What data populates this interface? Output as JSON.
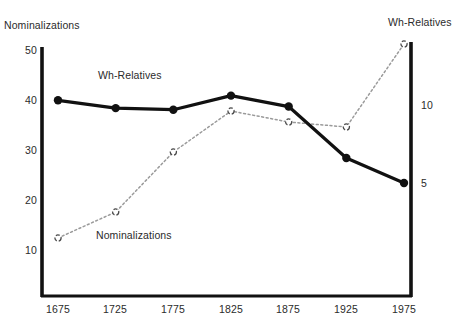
{
  "chart_data": {
    "type": "line",
    "title": "",
    "xlabel": "",
    "ylabel": "Nominalizations",
    "y2label": "Wh-Relatives",
    "categories": [
      "1675",
      "1725",
      "1775",
      "1825",
      "1875",
      "1925",
      "1975"
    ],
    "x": [
      1675,
      1725,
      1775,
      1825,
      1875,
      1925,
      1975
    ],
    "xlim": [
      1660,
      1990
    ],
    "ylim": [
      0.4,
      50.4
    ],
    "y2lim": [
      0.6,
      13.9
    ],
    "grid": false,
    "legend_position": "inline-annotation",
    "series": [
      {
        "name": "Nominalizations",
        "axis": "left",
        "style": "dotted",
        "marker": "open-circle",
        "color": "#8c8c8c",
        "values": [
          12.4,
          17.6,
          29.6,
          37.8,
          35.6,
          34.6,
          51.2
        ]
      },
      {
        "name": "Wh-Relatives",
        "axis": "right",
        "style": "solid",
        "marker": "filled-circle",
        "color": "#111111",
        "values": [
          10.3,
          9.8,
          9.7,
          10.6,
          9.9,
          6.6,
          5.0
        ]
      }
    ],
    "left_axis_ticks": [
      10,
      20,
      30,
      40,
      50
    ],
    "right_axis_ticks": [
      5,
      10
    ],
    "annotations": [
      {
        "text": "Wh-Relatives",
        "where": "inside-plot-upper-left"
      },
      {
        "text": "Nominalizations",
        "where": "inside-plot-lower-left"
      }
    ]
  },
  "axes": {
    "left_title": "Nominalizations",
    "right_title": "Wh-Relatives",
    "left_ticks": [
      "50",
      "40",
      "30",
      "20",
      "10"
    ],
    "right_ticks": [
      "10",
      "5"
    ],
    "x_ticks": [
      "1675",
      "1725",
      "1775",
      "1825",
      "1875",
      "1925",
      "1975"
    ]
  },
  "series_labels": {
    "wh_relatives": "Wh-Relatives",
    "nominalizations": "Nominalizations"
  },
  "colors": {
    "solid_series": "#111111",
    "dotted_series": "#8c8c8c",
    "axis": "#111111",
    "text": "#2b2b2b",
    "background": "#ffffff"
  }
}
